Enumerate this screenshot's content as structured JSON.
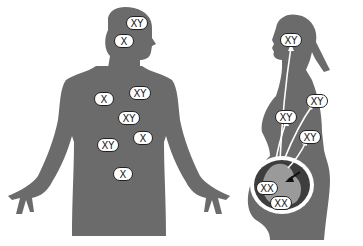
{
  "figures": {
    "male": {
      "description": "male body silhouette with mixed cells",
      "labels": [
        {
          "text": "XY",
          "x": 126,
          "y": 16,
          "cls": "w-xy"
        },
        {
          "text": "X",
          "x": 114,
          "y": 34,
          "cls": "w-x"
        },
        {
          "text": "X",
          "x": 94,
          "y": 92,
          "cls": "w-x"
        },
        {
          "text": "XY",
          "x": 129,
          "y": 86,
          "cls": "w-xy"
        },
        {
          "text": "XY",
          "x": 118,
          "y": 111,
          "cls": "w-xy"
        },
        {
          "text": "X",
          "x": 133,
          "y": 131,
          "cls": "w-x"
        },
        {
          "text": "XY",
          "x": 97,
          "y": 138,
          "cls": "w-xy"
        },
        {
          "text": "X",
          "x": 113,
          "y": 167,
          "cls": "w-x"
        }
      ]
    },
    "pregnant_female": {
      "description": "pregnant woman silhouette showing fetal cells migrating",
      "labels": [
        {
          "text": "XY",
          "x": 280,
          "y": 33,
          "cls": "w-xy"
        },
        {
          "text": "XY",
          "x": 306,
          "y": 94,
          "cls": "w-xy"
        },
        {
          "text": "XY",
          "x": 275,
          "y": 110,
          "cls": "w-xy"
        },
        {
          "text": "XY",
          "x": 299,
          "y": 130,
          "cls": "w-xy"
        },
        {
          "text": "XX",
          "x": 256,
          "y": 181,
          "cls": "w-xy"
        },
        {
          "text": "XX",
          "x": 270,
          "y": 196,
          "cls": "w-xy"
        }
      ]
    }
  },
  "colors": {
    "silhouette": "#6b6b6b",
    "uterus": "#3e3e3e",
    "fetus": "#9a9a9a",
    "arrow": "#ffffff",
    "label_bg": "#ffffff",
    "label_border": "#222222"
  }
}
